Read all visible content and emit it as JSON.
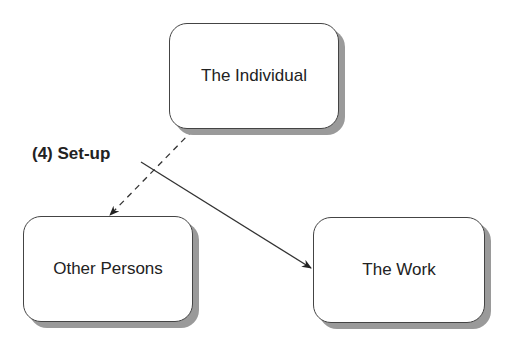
{
  "diagram": {
    "nodes": [
      {
        "id": "individual",
        "label": "The Individual"
      },
      {
        "id": "others",
        "label": "Other Persons"
      },
      {
        "id": "work",
        "label": "The Work"
      }
    ],
    "edges": [
      {
        "from": "individual",
        "to": "others",
        "style": "dashed",
        "direction": "both"
      },
      {
        "from": "setup-label",
        "to": "work",
        "style": "solid",
        "direction": "forward"
      }
    ],
    "annotation": "(4) Set-up"
  }
}
